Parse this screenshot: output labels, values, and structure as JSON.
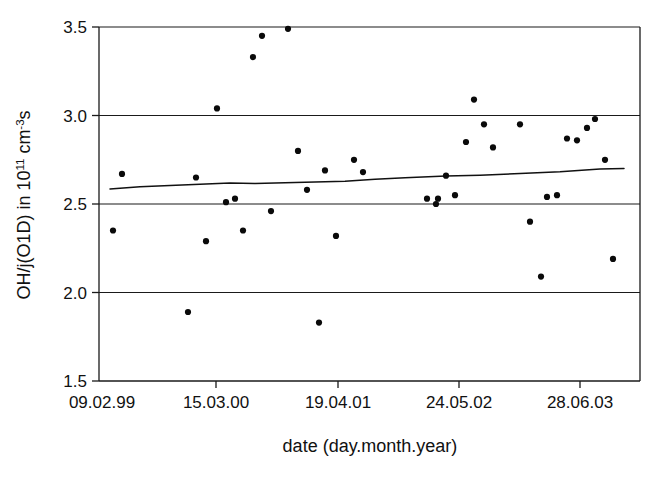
{
  "chart_data": {
    "type": "scatter",
    "title": "",
    "xlabel": "date (day.month.year)",
    "ylabel_parts": {
      "prefix": "OH/j(O1D) in 10",
      "exp1": "11",
      "mid": " cm",
      "exp2": "-3",
      "suffix": "s"
    },
    "ylabel": "OH/j(O1D) in 10^11 cm^-3 s",
    "grid": "horizontal",
    "legend": "none",
    "xtick_labels": [
      "09.02.99",
      "15.03.00",
      "19.04.01",
      "24.05.02",
      "28.06.03"
    ],
    "ytick_labels": [
      "1.5",
      "2.0",
      "2.5",
      "3.0",
      "3.5"
    ],
    "ytick_values": [
      1.5,
      2.0,
      2.5,
      3.0,
      3.5
    ],
    "ylim": [
      1.5,
      3.5
    ],
    "xlim_px": [
      99,
      640
    ],
    "xtick_px": [
      216,
      338,
      459,
      580
    ],
    "series": [
      {
        "name": "OH/j(O1D) observations",
        "marker": "filled-circle",
        "color": "#0a0a0a",
        "points": [
          {
            "px": 113,
            "value": 2.35
          },
          {
            "px": 122,
            "value": 2.67
          },
          {
            "px": 188,
            "value": 1.89
          },
          {
            "px": 196,
            "value": 2.65
          },
          {
            "px": 206,
            "value": 2.29
          },
          {
            "px": 217,
            "value": 3.04
          },
          {
            "px": 226,
            "value": 2.51
          },
          {
            "px": 235,
            "value": 2.53
          },
          {
            "px": 243,
            "value": 2.35
          },
          {
            "px": 253,
            "value": 3.33
          },
          {
            "px": 262,
            "value": 3.45
          },
          {
            "px": 271,
            "value": 2.46
          },
          {
            "px": 288,
            "value": 3.49
          },
          {
            "px": 298,
            "value": 2.8
          },
          {
            "px": 307,
            "value": 2.58
          },
          {
            "px": 319,
            "value": 1.83
          },
          {
            "px": 325,
            "value": 2.69
          },
          {
            "px": 336,
            "value": 2.32
          },
          {
            "px": 354,
            "value": 2.75
          },
          {
            "px": 363,
            "value": 2.68
          },
          {
            "px": 427,
            "value": 2.53
          },
          {
            "px": 436,
            "value": 2.5
          },
          {
            "px": 438,
            "value": 2.53
          },
          {
            "px": 446,
            "value": 2.66
          },
          {
            "px": 455,
            "value": 2.55
          },
          {
            "px": 466,
            "value": 2.85
          },
          {
            "px": 474,
            "value": 3.09
          },
          {
            "px": 484,
            "value": 2.95
          },
          {
            "px": 493,
            "value": 2.82
          },
          {
            "px": 520,
            "value": 2.95
          },
          {
            "px": 530,
            "value": 2.4
          },
          {
            "px": 541,
            "value": 2.09
          },
          {
            "px": 547,
            "value": 2.54
          },
          {
            "px": 557,
            "value": 2.55
          },
          {
            "px": 567,
            "value": 2.87
          },
          {
            "px": 577,
            "value": 2.86
          },
          {
            "px": 587,
            "value": 2.93
          },
          {
            "px": 595,
            "value": 2.98
          },
          {
            "px": 605,
            "value": 2.75
          },
          {
            "px": 613,
            "value": 2.19
          }
        ]
      }
    ],
    "trend": {
      "name": "running mean / fit",
      "style": "solid-line",
      "color": "#111111",
      "points": [
        {
          "px": 110,
          "value": 2.585
        },
        {
          "px": 140,
          "value": 2.598
        },
        {
          "px": 170,
          "value": 2.604
        },
        {
          "px": 200,
          "value": 2.612
        },
        {
          "px": 230,
          "value": 2.618
        },
        {
          "px": 255,
          "value": 2.616
        },
        {
          "px": 285,
          "value": 2.62
        },
        {
          "px": 315,
          "value": 2.624
        },
        {
          "px": 345,
          "value": 2.628
        },
        {
          "px": 375,
          "value": 2.64
        },
        {
          "px": 405,
          "value": 2.648
        },
        {
          "px": 446,
          "value": 2.658
        },
        {
          "px": 480,
          "value": 2.662
        },
        {
          "px": 520,
          "value": 2.672
        },
        {
          "px": 560,
          "value": 2.682
        },
        {
          "px": 600,
          "value": 2.697
        },
        {
          "px": 624,
          "value": 2.7
        }
      ]
    }
  }
}
